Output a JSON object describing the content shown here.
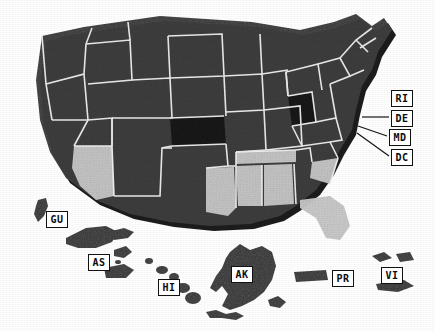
{
  "map": {
    "title": "United States choropleth map",
    "background_color": "#fefefe",
    "colors": {
      "fill_dark": "#3f3f3f",
      "fill_darkest": "#1a1a1a",
      "fill_light": "#c9c9c9",
      "border": "#f2f2f2",
      "shadow": "#101010",
      "label_text": "#0b0b0b",
      "label_box": "#ffffff",
      "label_border": "#111111",
      "leader_line": "#151515"
    },
    "legend_shades": [
      {
        "name": "darkest",
        "color": "#1a1a1a"
      },
      {
        "name": "dark",
        "color": "#3f3f3f"
      },
      {
        "name": "light",
        "color": "#c9c9c9"
      }
    ],
    "callouts": [
      {
        "code": "RI",
        "name": "rhode-island",
        "x": 391,
        "y": 90,
        "leader": false
      },
      {
        "code": "DE",
        "name": "delaware",
        "x": 391,
        "y": 110,
        "leader": true,
        "lx1": 389,
        "ly1": 117,
        "lx2": 362,
        "ly2": 117
      },
      {
        "code": "MD",
        "name": "maryland",
        "x": 389,
        "y": 129,
        "leader": true,
        "lx1": 387,
        "ly1": 136,
        "lx2": 358,
        "ly2": 126
      },
      {
        "code": "DC",
        "name": "district-of-columbia",
        "x": 391,
        "y": 149,
        "leader": true,
        "lx1": 389,
        "ly1": 156,
        "lx2": 357,
        "ly2": 133
      }
    ],
    "territory_labels": [
      {
        "code": "GU",
        "name": "guam",
        "x": 46,
        "y": 211
      },
      {
        "code": "AS",
        "name": "american-samoa",
        "x": 88,
        "y": 254
      },
      {
        "code": "HI",
        "name": "hawaii",
        "x": 158,
        "y": 279
      },
      {
        "code": "AK",
        "name": "alaska",
        "x": 231,
        "y": 266
      },
      {
        "code": "PR",
        "name": "puerto-rico",
        "x": 332,
        "y": 270
      },
      {
        "code": "VI",
        "name": "virgin-islands",
        "x": 381,
        "y": 267
      }
    ],
    "states": [
      {
        "code": "WA",
        "name": "washington",
        "shade": "dark"
      },
      {
        "code": "OR",
        "name": "oregon",
        "shade": "dark"
      },
      {
        "code": "CA",
        "name": "california",
        "shade": "dark"
      },
      {
        "code": "NV",
        "name": "nevada",
        "shade": "dark"
      },
      {
        "code": "ID",
        "name": "idaho",
        "shade": "dark"
      },
      {
        "code": "MT",
        "name": "montana",
        "shade": "dark"
      },
      {
        "code": "WY",
        "name": "wyoming",
        "shade": "dark"
      },
      {
        "code": "UT",
        "name": "utah",
        "shade": "dark"
      },
      {
        "code": "AZ",
        "name": "arizona",
        "shade": "light"
      },
      {
        "code": "NM",
        "name": "new-mexico",
        "shade": "dark"
      },
      {
        "code": "CO",
        "name": "colorado",
        "shade": "dark"
      },
      {
        "code": "ND",
        "name": "north-dakota",
        "shade": "dark"
      },
      {
        "code": "SD",
        "name": "south-dakota",
        "shade": "dark"
      },
      {
        "code": "NE",
        "name": "nebraska",
        "shade": "dark"
      },
      {
        "code": "KS",
        "name": "kansas",
        "shade": "darkest"
      },
      {
        "code": "OK",
        "name": "oklahoma",
        "shade": "dark"
      },
      {
        "code": "TX",
        "name": "texas",
        "shade": "dark"
      },
      {
        "code": "MN",
        "name": "minnesota",
        "shade": "dark"
      },
      {
        "code": "IA",
        "name": "iowa",
        "shade": "dark"
      },
      {
        "code": "MO",
        "name": "missouri",
        "shade": "dark"
      },
      {
        "code": "AR",
        "name": "arkansas",
        "shade": "dark"
      },
      {
        "code": "LA",
        "name": "louisiana",
        "shade": "light"
      },
      {
        "code": "WI",
        "name": "wisconsin",
        "shade": "dark"
      },
      {
        "code": "IL",
        "name": "illinois",
        "shade": "dark"
      },
      {
        "code": "MS",
        "name": "mississippi",
        "shade": "light"
      },
      {
        "code": "AL",
        "name": "alabama",
        "shade": "light"
      },
      {
        "code": "TN",
        "name": "tennessee",
        "shade": "light"
      },
      {
        "code": "KY",
        "name": "kentucky",
        "shade": "dark"
      },
      {
        "code": "IN",
        "name": "indiana",
        "shade": "dark"
      },
      {
        "code": "MI",
        "name": "michigan",
        "shade": "dark"
      },
      {
        "code": "OH",
        "name": "ohio",
        "shade": "darkest"
      },
      {
        "code": "WV",
        "name": "west-virginia",
        "shade": "dark"
      },
      {
        "code": "VA",
        "name": "virginia",
        "shade": "dark"
      },
      {
        "code": "NC",
        "name": "north-carolina",
        "shade": "dark"
      },
      {
        "code": "SC",
        "name": "south-carolina",
        "shade": "light"
      },
      {
        "code": "GA",
        "name": "georgia",
        "shade": "dark"
      },
      {
        "code": "FL",
        "name": "florida",
        "shade": "light"
      },
      {
        "code": "PA",
        "name": "pennsylvania",
        "shade": "dark"
      },
      {
        "code": "NY",
        "name": "new-york",
        "shade": "dark"
      },
      {
        "code": "VT",
        "name": "vermont",
        "shade": "dark"
      },
      {
        "code": "NH",
        "name": "new-hampshire",
        "shade": "dark"
      },
      {
        "code": "ME",
        "name": "maine",
        "shade": "dark"
      },
      {
        "code": "MA",
        "name": "massachusetts",
        "shade": "dark"
      },
      {
        "code": "CT",
        "name": "connecticut",
        "shade": "dark"
      },
      {
        "code": "RI",
        "name": "rhode-island",
        "shade": "dark"
      },
      {
        "code": "NJ",
        "name": "new-jersey",
        "shade": "dark"
      },
      {
        "code": "DE",
        "name": "delaware",
        "shade": "dark"
      },
      {
        "code": "MD",
        "name": "maryland",
        "shade": "dark"
      },
      {
        "code": "DC",
        "name": "district-of-columbia",
        "shade": "dark"
      },
      {
        "code": "AK",
        "name": "alaska",
        "shade": "dark"
      },
      {
        "code": "HI",
        "name": "hawaii",
        "shade": "dark"
      },
      {
        "code": "PR",
        "name": "puerto-rico",
        "shade": "dark"
      },
      {
        "code": "VI",
        "name": "virgin-islands",
        "shade": "dark"
      },
      {
        "code": "GU",
        "name": "guam",
        "shade": "dark"
      },
      {
        "code": "AS",
        "name": "american-samoa",
        "shade": "dark"
      }
    ]
  }
}
